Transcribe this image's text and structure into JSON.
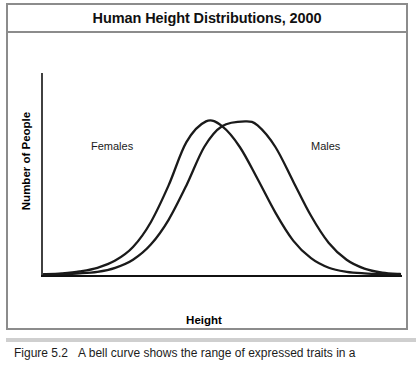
{
  "figure": {
    "title": "Human Height Distributions, 2000",
    "credit": "© Infobase Publishing"
  },
  "caption": {
    "label": "Figure 5.2",
    "text": "A bell curve shows the range of expressed traits in a"
  },
  "chart_data": {
    "type": "line",
    "title": "Human Height Distributions, 2000",
    "xlabel": "Height",
    "ylabel": "Number of People",
    "grid": false,
    "legend_position": "inline-annotations",
    "axis_style": "open-left-bottom",
    "xlim": [
      0,
      1
    ],
    "ylim": [
      0,
      1
    ],
    "series": [
      {
        "name": "Females",
        "label_position": "upper-left",
        "color": "#1a1a1a",
        "peak_x": 0.455,
        "peak_y": 0.96,
        "sigma": 0.135,
        "x": [
          0.0,
          0.05,
          0.1,
          0.15,
          0.2,
          0.25,
          0.3,
          0.35,
          0.4,
          0.455,
          0.5,
          0.55,
          0.6,
          0.65,
          0.7,
          0.75,
          0.8,
          0.85,
          0.9,
          0.95,
          1.0
        ],
        "y": [
          0.005,
          0.01,
          0.022,
          0.045,
          0.09,
          0.175,
          0.33,
          0.56,
          0.83,
          0.96,
          0.93,
          0.8,
          0.6,
          0.39,
          0.215,
          0.105,
          0.045,
          0.02,
          0.01,
          0.005,
          0.003
        ]
      },
      {
        "name": "Males",
        "label_position": "upper-right",
        "color": "#1a1a1a",
        "peak_x": 0.565,
        "peak_y": 0.96,
        "sigma": 0.135,
        "x": [
          0.0,
          0.05,
          0.1,
          0.15,
          0.2,
          0.25,
          0.3,
          0.35,
          0.4,
          0.45,
          0.5,
          0.565,
          0.6,
          0.65,
          0.7,
          0.75,
          0.8,
          0.85,
          0.9,
          0.95,
          1.0
        ],
        "y": [
          0.003,
          0.005,
          0.01,
          0.02,
          0.045,
          0.095,
          0.19,
          0.345,
          0.56,
          0.8,
          0.93,
          0.96,
          0.935,
          0.8,
          0.585,
          0.37,
          0.2,
          0.095,
          0.04,
          0.015,
          0.006
        ]
      }
    ],
    "annotations": [
      {
        "text": "Females",
        "x": 0.13,
        "y": 0.78
      },
      {
        "text": "Males",
        "x": 0.74,
        "y": 0.78
      }
    ]
  }
}
